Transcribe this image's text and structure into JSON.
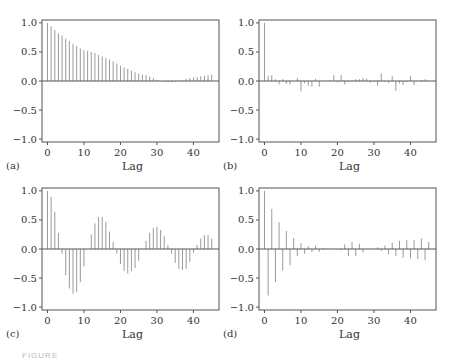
{
  "figure": {
    "caption_partial": "FIGURE",
    "panel_labels": [
      "(a)",
      "(b)",
      "(c)",
      "(d)"
    ]
  },
  "style": {
    "axis_color": "#555555",
    "stem_color": "#9a9a9a",
    "text_color": "#333333"
  },
  "chart_data": [
    {
      "type": "bar",
      "subtype": "stem",
      "panel": "(a)",
      "title": "",
      "xlabel": "Lag",
      "ylabel": "",
      "xlim": [
        -1.5,
        47
      ],
      "ylim": [
        -1.05,
        1.05
      ],
      "xticks": [
        0,
        10,
        20,
        30,
        40
      ],
      "yticks": [
        -1.0,
        -0.5,
        0.0,
        0.5,
        1.0
      ],
      "ytick_labels": [
        "−1.0",
        "−0.5",
        "0.0",
        "0.5",
        "1.0"
      ],
      "grid": false,
      "x": [
        0,
        1,
        2,
        3,
        4,
        5,
        6,
        7,
        8,
        9,
        10,
        11,
        12,
        13,
        14,
        15,
        16,
        17,
        18,
        19,
        20,
        21,
        22,
        23,
        24,
        25,
        26,
        27,
        28,
        29,
        30,
        31,
        32,
        33,
        34,
        35,
        36,
        37,
        38,
        39,
        40,
        41,
        42,
        43,
        44,
        45
      ],
      "values": [
        1.0,
        0.94,
        0.88,
        0.82,
        0.78,
        0.73,
        0.69,
        0.64,
        0.6,
        0.56,
        0.53,
        0.52,
        0.5,
        0.48,
        0.45,
        0.42,
        0.4,
        0.37,
        0.34,
        0.3,
        0.26,
        0.23,
        0.21,
        0.18,
        0.15,
        0.13,
        0.11,
        0.1,
        0.08,
        0.05,
        0.02,
        0.0,
        -0.01,
        -0.02,
        -0.02,
        -0.01,
        0.0,
        0.01,
        0.04,
        0.05,
        0.06,
        0.07,
        0.08,
        0.09,
        0.1,
        0.11
      ]
    },
    {
      "type": "bar",
      "subtype": "stem",
      "panel": "(b)",
      "title": "",
      "xlabel": "Lag",
      "ylabel": "",
      "xlim": [
        -1.5,
        47
      ],
      "ylim": [
        -1.05,
        1.05
      ],
      "xticks": [
        0,
        10,
        20,
        30,
        40
      ],
      "yticks": [
        -1.0,
        -0.5,
        0.0,
        0.5,
        1.0
      ],
      "ytick_labels": [
        "−1.0",
        "−0.5",
        "0.0",
        "0.5",
        "1.0"
      ],
      "grid": false,
      "x": [
        0,
        1,
        2,
        3,
        4,
        5,
        6,
        7,
        8,
        9,
        10,
        11,
        12,
        13,
        14,
        15,
        16,
        17,
        18,
        19,
        20,
        21,
        22,
        23,
        24,
        25,
        26,
        27,
        28,
        29,
        30,
        31,
        32,
        33,
        34,
        35,
        36,
        37,
        38,
        39,
        40,
        41,
        42,
        43,
        44,
        45
      ],
      "values": [
        1.0,
        0.09,
        0.1,
        0.03,
        -0.06,
        0.03,
        -0.05,
        -0.06,
        0.0,
        0.05,
        -0.18,
        -0.04,
        -0.08,
        -0.1,
        0.04,
        -0.1,
        0.0,
        0.0,
        0.01,
        0.1,
        -0.02,
        0.1,
        -0.06,
        -0.02,
        0.01,
        0.03,
        0.03,
        0.05,
        0.04,
        -0.03,
        -0.02,
        -0.08,
        0.13,
        -0.02,
        -0.03,
        0.08,
        -0.17,
        -0.04,
        -0.07,
        -0.02,
        0.09,
        -0.07,
        0.0,
        0.02,
        0.03,
        -0.01
      ]
    },
    {
      "type": "bar",
      "subtype": "stem",
      "panel": "(c)",
      "title": "",
      "xlabel": "Lag",
      "ylabel": "",
      "xlim": [
        -1.5,
        47
      ],
      "ylim": [
        -1.05,
        1.05
      ],
      "xticks": [
        0,
        10,
        20,
        30,
        40
      ],
      "yticks": [
        -1.0,
        -0.5,
        0.0,
        0.5,
        1.0
      ],
      "ytick_labels": [
        "−1.0",
        "−0.5",
        "0.0",
        "0.5",
        "1.0"
      ],
      "grid": false,
      "x": [
        0,
        1,
        2,
        3,
        4,
        5,
        6,
        7,
        8,
        9,
        10,
        11,
        12,
        13,
        14,
        15,
        16,
        17,
        18,
        19,
        20,
        21,
        22,
        23,
        24,
        25,
        26,
        27,
        28,
        29,
        30,
        31,
        32,
        33,
        34,
        35,
        36,
        37,
        38,
        39,
        40,
        41,
        42,
        43,
        44,
        45
      ],
      "values": [
        1.0,
        0.9,
        0.64,
        0.28,
        -0.08,
        -0.45,
        -0.68,
        -0.77,
        -0.74,
        -0.57,
        -0.3,
        0.0,
        0.25,
        0.44,
        0.55,
        0.55,
        0.47,
        0.3,
        0.12,
        -0.08,
        -0.26,
        -0.38,
        -0.42,
        -0.38,
        -0.33,
        -0.2,
        0.0,
        0.14,
        0.28,
        0.36,
        0.38,
        0.33,
        0.22,
        0.07,
        -0.08,
        -0.24,
        -0.34,
        -0.36,
        -0.34,
        -0.22,
        -0.06,
        0.07,
        0.18,
        0.24,
        0.24,
        0.18
      ]
    },
    {
      "type": "bar",
      "subtype": "stem",
      "panel": "(d)",
      "title": "",
      "xlabel": "Lag",
      "ylabel": "",
      "xlim": [
        -1.5,
        47
      ],
      "ylim": [
        -1.05,
        1.05
      ],
      "xticks": [
        0,
        10,
        20,
        30,
        40
      ],
      "yticks": [
        -1.0,
        -0.5,
        0.0,
        0.5,
        1.0
      ],
      "ytick_labels": [
        "−1.0",
        "−0.5",
        "0.0",
        "0.5",
        "1.0"
      ],
      "grid": false,
      "x": [
        0,
        1,
        2,
        3,
        4,
        5,
        6,
        7,
        8,
        9,
        10,
        11,
        12,
        13,
        14,
        15,
        16,
        17,
        18,
        19,
        20,
        21,
        22,
        23,
        24,
        25,
        26,
        27,
        28,
        29,
        30,
        31,
        32,
        33,
        34,
        35,
        36,
        37,
        38,
        39,
        40,
        41,
        42,
        43,
        44,
        45
      ],
      "values": [
        1.0,
        -0.8,
        0.69,
        -0.57,
        0.46,
        -0.37,
        0.31,
        -0.28,
        0.19,
        -0.12,
        0.1,
        -0.08,
        0.05,
        -0.05,
        0.06,
        -0.05,
        0.02,
        0.0,
        0.0,
        0.0,
        0.0,
        -0.02,
        0.08,
        -0.12,
        0.12,
        -0.12,
        0.09,
        -0.06,
        0.0,
        0.0,
        0.0,
        0.03,
        -0.03,
        0.06,
        -0.09,
        0.11,
        -0.12,
        0.14,
        -0.15,
        0.15,
        -0.16,
        0.15,
        -0.17,
        0.18,
        -0.19,
        0.12
      ]
    }
  ]
}
